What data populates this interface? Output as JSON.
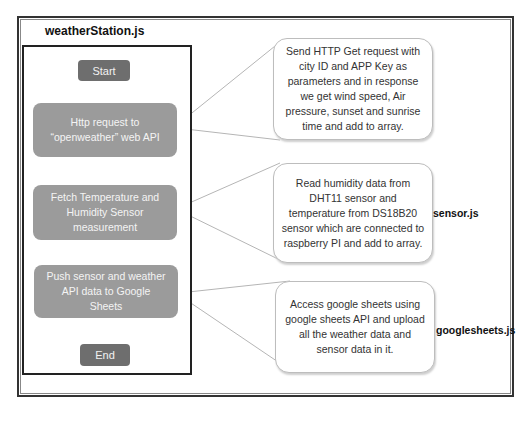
{
  "diagram": {
    "title": "weatherStation.js",
    "flow": {
      "start": "Start",
      "steps": [
        {
          "line1": "Http request to",
          "line2": "“openweather” web API"
        },
        {
          "line1": "Fetch Temperature and",
          "line2": "Humidity Sensor",
          "line3": "measurement"
        },
        {
          "line1": "Push sensor and weather",
          "line2": "API data to Google",
          "line3": "Sheets"
        }
      ],
      "end": "End"
    },
    "callouts": [
      {
        "text": "Send HTTP Get request with city ID and APP Key as parameters and in response we get wind speed, Air pressure, sunset and sunrise time  and add to array.",
        "file": ""
      },
      {
        "text": "Read humidity data from DHT11 sensor and temperature from DS18B20 sensor which are connected to raspberry PI and add to array.",
        "file": "sensor.js"
      },
      {
        "text": "Access  google sheets using google sheets API and upload all the weather data and sensor data in it.",
        "file": "googlesheets.js"
      }
    ],
    "colors": {
      "terminal": "#6e6e6e",
      "process": "#9b9b9b",
      "frame": "#222222",
      "connector": "#aaaaaa"
    }
  }
}
